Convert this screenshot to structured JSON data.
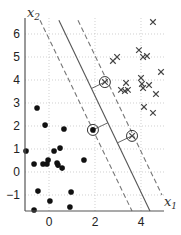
{
  "chart_data": {
    "type": "scatter",
    "title": "",
    "xlabel": "x1",
    "ylabel": "x2",
    "xlabel_main": "x",
    "xlabel_sub": "1",
    "ylabel_main": "x",
    "ylabel_sub": "2",
    "xlim": [
      -1.05,
      5.0
    ],
    "ylim": [
      -1.75,
      6.5
    ],
    "grid": true,
    "legend": null,
    "xticks": [
      0,
      2,
      4
    ],
    "xtick_labels": [
      "0",
      "2",
      "4"
    ],
    "yticks": [
      -1,
      0,
      1,
      2,
      3,
      4,
      5,
      6
    ],
    "ytick_labels": [
      "−1",
      "0",
      "1",
      "2",
      "3",
      "4",
      "5",
      "6"
    ],
    "series": [
      {
        "name": "class -1 (dots)",
        "marker": "dot",
        "color": "#111111",
        "points": [
          [
            -0.52,
            2.78
          ],
          [
            -0.17,
            2.04
          ],
          [
            0.65,
            1.87
          ],
          [
            -1.0,
            0.91
          ],
          [
            0.22,
            0.91
          ],
          [
            0.48,
            1.04
          ],
          [
            -0.65,
            0.35
          ],
          [
            -0.26,
            0.35
          ],
          [
            -0.09,
            0.35
          ],
          [
            -0.04,
            0.52
          ],
          [
            0.35,
            0.39
          ],
          [
            0.39,
            0.3
          ],
          [
            0.57,
            0.17
          ],
          [
            1.52,
            0.52
          ],
          [
            -0.48,
            -0.83
          ],
          [
            0.04,
            -1.26
          ],
          [
            0.96,
            -0.87
          ],
          [
            -0.65,
            -1.65
          ],
          [
            0.91,
            -1.52
          ]
        ]
      },
      {
        "name": "class +1 (crosses)",
        "marker": "x",
        "color": "#444444",
        "points": [
          [
            4.52,
            6.52
          ],
          [
            2.78,
            4.83
          ],
          [
            2.96,
            5.0
          ],
          [
            3.91,
            5.3
          ],
          [
            4.09,
            5.0
          ],
          [
            4.26,
            5.04
          ],
          [
            4.87,
            4.35
          ],
          [
            3.35,
            3.87
          ],
          [
            3.13,
            3.57
          ],
          [
            3.3,
            3.52
          ],
          [
            3.43,
            3.57
          ],
          [
            4.0,
            4.09
          ],
          [
            4.04,
            3.83
          ],
          [
            4.09,
            3.65
          ],
          [
            4.35,
            3.78
          ],
          [
            4.65,
            3.39
          ],
          [
            4.13,
            2.83
          ],
          [
            4.52,
            2.57
          ]
        ]
      }
    ],
    "support_vectors": [
      {
        "marker": "dot",
        "point": [
          1.91,
          1.83
        ]
      },
      {
        "marker": "x",
        "point": [
          2.43,
          3.91
        ]
      },
      {
        "marker": "x",
        "point": [
          3.61,
          1.57
        ]
      }
    ],
    "lines": [
      {
        "name": "decision boundary",
        "style": "solid",
        "from": [
          0.43,
          6.6
        ],
        "to": [
          4.39,
          -1.7
        ]
      },
      {
        "name": "margin (dot side)",
        "style": "dashed",
        "from": [
          -0.39,
          6.6
        ],
        "to": [
          3.61,
          -1.7
        ]
      },
      {
        "name": "margin (cross side)",
        "style": "dashed",
        "from": [
          1.26,
          6.6
        ],
        "to": [
          4.91,
          -1.0
        ]
      }
    ],
    "annotations": [
      "Perpendicular segments connect each circled support vector to the decision boundary"
    ]
  }
}
